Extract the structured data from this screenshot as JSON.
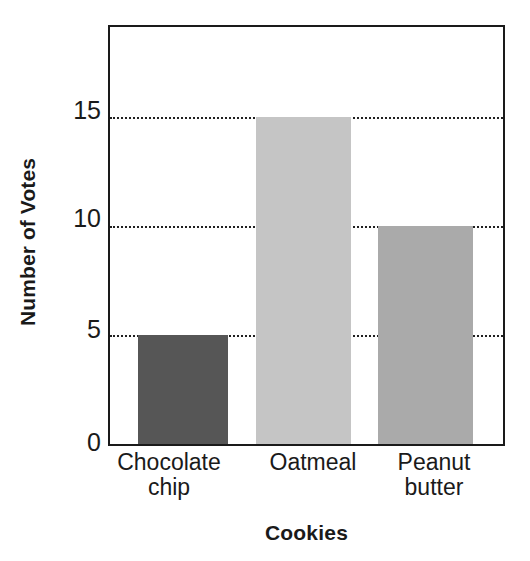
{
  "chart_data": {
    "type": "bar",
    "title": "",
    "xlabel": "Cookies",
    "ylabel": "Number of Votes",
    "categories": [
      "Chocolate chip",
      "Oatmeal",
      "Peanut butter"
    ],
    "category_lines": [
      [
        "Chocolate",
        "chip"
      ],
      [
        "Oatmeal"
      ],
      [
        "Peanut",
        "butter"
      ]
    ],
    "values": [
      5,
      15,
      10
    ],
    "bar_colors": [
      "#565656",
      "#c5c5c5",
      "#aaaaaa"
    ],
    "ylim": [
      0,
      19.1
    ],
    "ytick_labels": [
      "0",
      "5",
      "10",
      "15"
    ],
    "ytick_values": [
      0,
      5,
      10,
      15
    ],
    "gridlines": {
      "visible_at": [
        5,
        10,
        15
      ],
      "style": "dotted",
      "color": "#202020"
    },
    "xtick_labels": [
      "Chocolate chip",
      "Oatmeal",
      "Peanut butter"
    ],
    "axis_color": "#1a1a1a",
    "background": "#ffffff",
    "legend": null,
    "legend_position": "none"
  },
  "axes": {
    "y_title": "Number of Votes",
    "x_title": "Cookies"
  },
  "ticks": {
    "y": [
      {
        "label": "15",
        "value": 15
      },
      {
        "label": "10",
        "value": 10
      },
      {
        "label": "5",
        "value": 5
      },
      {
        "label": "0",
        "value": 0
      }
    ]
  },
  "bars": [
    {
      "label": "Chocolate chip",
      "line1": "Chocolate",
      "line2": "chip",
      "value": 5,
      "color": "#565656"
    },
    {
      "label": "Oatmeal",
      "line1": "Oatmeal",
      "line2": "",
      "value": 15,
      "color": "#c5c5c5"
    },
    {
      "label": "Peanut butter",
      "line1": "Peanut",
      "line2": "butter",
      "value": 10,
      "color": "#aaaaaa"
    }
  ]
}
